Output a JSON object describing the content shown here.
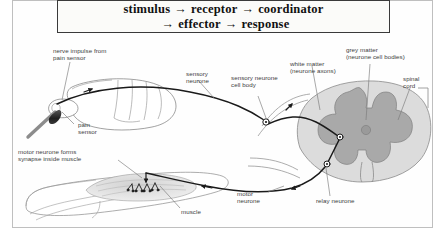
{
  "figure": {
    "title_sequence": {
      "line1": [
        "stimulus",
        "receptor",
        "coordinator"
      ],
      "line2": [
        "effector",
        "response"
      ],
      "arrow_glyph": "→",
      "full_text": "stimulus → receptor → coordinator → effector → response"
    },
    "labels": {
      "nerve_impulse": "nerve impulse from\npain sensor",
      "pain_sensor": "pain\nsensor",
      "sensory_neurone": "sensory\nneurone",
      "sensory_cell_body": "sensory neurone\ncell body",
      "white_matter": "white matter\n(neurone axons)",
      "grey_matter": "grey matter\n(neurone cell bodies)",
      "spinal_cord": "spinal\ncord",
      "relay_neurone": "relay neurone",
      "motor_neurone": "motor\nneurone",
      "motor_synapse": "motor neurone forms\nsynapse inside muscle",
      "muscle": "muscle"
    },
    "colors": {
      "page_background": "#ffffff",
      "frame_border": "#bfbfbf",
      "header_border": "#3a3a3a",
      "header_fill": "#fbfbf9",
      "text": "#3d3d3d",
      "title_text": "#111111",
      "outline": "#6e6e6e",
      "nerve_path": "#1a1a1a",
      "white_matter_fill": "#dcdcdc",
      "grey_matter_fill": "#a9a9a9",
      "muscle_fill": "#e3e3e3",
      "flame_fill": "#2e2e2e",
      "match_stick": "#8c8c8c"
    }
  }
}
